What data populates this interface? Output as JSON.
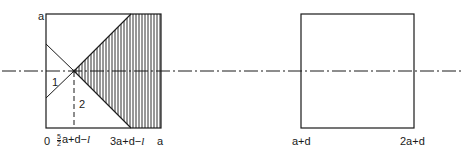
{
  "left_figure": {
    "y_axis_label": "a",
    "region_labels": {
      "region_1": "1",
      "region_2": "2"
    },
    "x_labels": {
      "origin": "0",
      "crossing_fraction_num": "5",
      "crossing_fraction_den": "2",
      "crossing_rest": "a+d−",
      "crossing_l": "l",
      "slant_end": "3a+d−",
      "slant_end_l": "l",
      "right": "a"
    }
  },
  "right_figure": {
    "x_labels": {
      "left": "a+d",
      "right": "2a+d"
    }
  },
  "colors": {
    "line": "#1a1a1a",
    "background": "#ffffff"
  }
}
